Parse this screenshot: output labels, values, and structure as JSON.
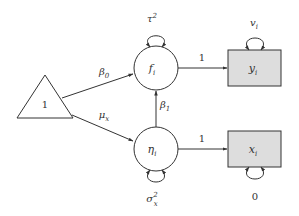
{
  "diagram": {
    "type": "path-diagram",
    "nodes": {
      "constant": {
        "label": "1",
        "shape": "triangle"
      },
      "f": {
        "label": "f",
        "subscript": "i",
        "shape": "circle",
        "variance": {
          "base": "τ",
          "sup": "2"
        }
      },
      "eta": {
        "label": "η",
        "subscript": "i",
        "shape": "circle",
        "variance": {
          "base": "σ",
          "sup": "2",
          "sub": "x"
        }
      },
      "y": {
        "label": "y",
        "subscript": "i",
        "shape": "rectangle",
        "fill": "#dddddd",
        "variance": {
          "base": "v",
          "sub": "i"
        }
      },
      "x": {
        "label": "x",
        "subscript": "i",
        "shape": "rectangle",
        "fill": "#dddddd",
        "variance": {
          "label": "0"
        }
      }
    },
    "edges": {
      "const_to_f": {
        "label": "β",
        "subscript": "0"
      },
      "const_to_eta": {
        "label": "μ",
        "subscript": "x"
      },
      "eta_to_f": {
        "label": "β",
        "subscript": "1"
      },
      "f_to_y": {
        "label": "1"
      },
      "eta_to_x": {
        "label": "1"
      }
    },
    "colors": {
      "stroke": "#333333",
      "box_fill": "#dddddd",
      "background": "#ffffff"
    }
  }
}
